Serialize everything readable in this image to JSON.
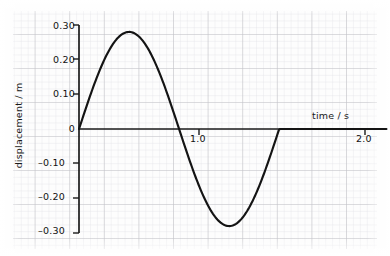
{
  "chart_data": {
    "type": "line",
    "title": "",
    "subtitle": "",
    "xlabel": "time / s",
    "ylabel": "displacement / m",
    "xlim": [
      0,
      2.15
    ],
    "ylim": [
      -0.3,
      0.3
    ],
    "grid": true,
    "grid_major_x": 0.2,
    "grid_minor_x": 0.04,
    "grid_major_y": 0.1,
    "grid_minor_y": 0.02,
    "legend": "none",
    "xticks": [
      1.0,
      2.0
    ],
    "xtick_labels": [
      "1.0",
      "2.0"
    ],
    "yticks": [
      0.3,
      0.2,
      0.1,
      0,
      -0.1,
      -0.2,
      -0.3
    ],
    "ytick_labels": [
      "0.30",
      "0.20",
      "0.10",
      "0",
      "–0.10",
      "–0.20",
      "–0.30"
    ],
    "annotations": [],
    "series": [
      {
        "name": "displacement",
        "color": "#141414",
        "line_width": 2.1,
        "waveform": "sine",
        "amplitude": 0.28,
        "period": 1.4,
        "phase": 0,
        "x": [
          0.0,
          0.05,
          0.1,
          0.15,
          0.2,
          0.25,
          0.3,
          0.35,
          0.4,
          0.45,
          0.5,
          0.55,
          0.6,
          0.65,
          0.7,
          0.75,
          0.8,
          0.85,
          0.9,
          0.95,
          1.0,
          1.05,
          1.1,
          1.15,
          1.2,
          1.25,
          1.3,
          1.35,
          1.4,
          1.45,
          1.5,
          1.55,
          1.6,
          1.65,
          1.7,
          1.75,
          1.8,
          1.85,
          1.9,
          1.95,
          2.0
        ],
        "y": [
          0.0,
          0.062,
          0.122,
          0.176,
          0.222,
          0.256,
          0.275,
          0.28,
          0.269,
          0.243,
          0.204,
          0.154,
          0.097,
          0.036,
          -0.027,
          -0.087,
          -0.142,
          -0.188,
          -0.224,
          -0.247,
          -0.256,
          -0.25,
          -0.23,
          -0.197,
          -0.152,
          -0.099,
          -0.042,
          0.0,
          0.0,
          0.0,
          0.0,
          0.0,
          0.0,
          0.0,
          0.0,
          0.0,
          0.0,
          0.0,
          0.0,
          0.0,
          0.0
        ]
      }
    ]
  },
  "labels": {
    "ylabel": "displacement / m",
    "xlabel": "time / s",
    "y_030": "0.30",
    "y_020": "0.20",
    "y_010": "0.10",
    "y_0": "0",
    "y_m010": "–0.10",
    "y_m020": "–0.20",
    "y_m030": "–0.30",
    "x_10": "1.0",
    "x_20": "2.0"
  },
  "colors": {
    "curve": "#141414",
    "axis": "#1a1a1a",
    "grid_major": "#c3c3c8",
    "grid_minor": "#e2e2e6",
    "background": "#fdfdfd"
  }
}
